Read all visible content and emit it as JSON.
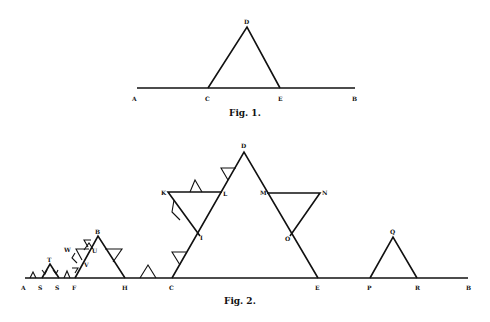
{
  "figure1": {
    "caption": "Fig. 1.",
    "labels": {
      "A": "A",
      "B": "B",
      "C": "C",
      "D": "D",
      "E": "E"
    }
  },
  "figure2": {
    "caption": "Fig. 2.",
    "labels": {
      "A": "A",
      "S1": "S",
      "S2": "S",
      "T": "T",
      "F": "F",
      "W": "W",
      "V": "V",
      "U": "U",
      "Bpt": "B",
      "H": "H",
      "C": "C",
      "D": "D",
      "K": "K",
      "L": "L",
      "I": "I",
      "M": "M",
      "N": "N",
      "O": "O",
      "E": "E",
      "P": "P",
      "Q": "Q",
      "R": "R",
      "Bend": "B"
    }
  }
}
